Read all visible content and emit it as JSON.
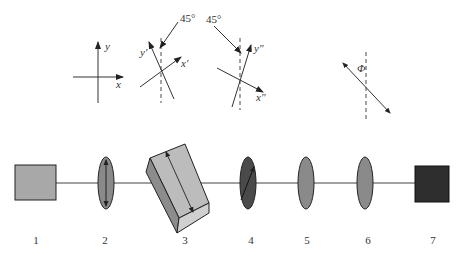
{
  "diagram": {
    "type": "optical-setup",
    "components": [
      {
        "id": "1",
        "label": "1",
        "shape": "square",
        "color": "#a8a8a8"
      },
      {
        "id": "2",
        "label": "2",
        "shape": "ellipse-lens",
        "color": "#8a8a8a",
        "polarization_arrow": "vertical"
      },
      {
        "id": "3",
        "label": "3",
        "shape": "tilted-prism",
        "color": "#b5b5b5"
      },
      {
        "id": "4",
        "label": "4",
        "shape": "ellipse-lens",
        "color": "#4a4a4a",
        "polarization_arrow": "diagonal"
      },
      {
        "id": "5",
        "label": "5",
        "shape": "ellipse-lens",
        "color": "#8a8a8a"
      },
      {
        "id": "6",
        "label": "6",
        "shape": "ellipse-lens",
        "color": "#8a8a8a"
      },
      {
        "id": "7",
        "label": "7",
        "shape": "square",
        "color": "#2e2e2e"
      }
    ],
    "axes_diagrams": [
      {
        "name": "original-axes",
        "x_label": "x",
        "y_label": "y"
      },
      {
        "name": "rotated-axes-prime",
        "x_label": "x′",
        "y_label": "y′",
        "angle_label": "45°"
      },
      {
        "name": "rotated-axes-double-prime",
        "x_label": "x″",
        "y_label": "y″",
        "angle_label": "45°"
      },
      {
        "name": "phi-axis",
        "angle_label": "Φ"
      }
    ]
  }
}
